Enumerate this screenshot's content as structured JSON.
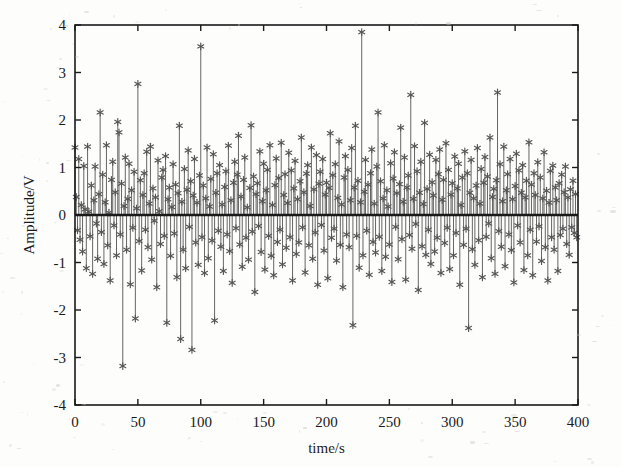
{
  "figure": {
    "background_color": "#fdfdfc",
    "axes_color": "#1a1a1a",
    "data_color": "#555555",
    "marker": "asterisk-marker",
    "plot_box": {
      "left": 75,
      "top": 25,
      "right": 578,
      "bottom": 405
    }
  },
  "chart_data": {
    "type": "line",
    "plot_style": "stem",
    "title": "",
    "subtitle": "",
    "xlabel": "time/s",
    "ylabel": "Amplitude/V",
    "xlim": [
      0,
      400
    ],
    "ylim": [
      -4,
      4
    ],
    "xticks": [
      0,
      50,
      100,
      150,
      200,
      250,
      300,
      350,
      400
    ],
    "xtick_labels": [
      "0",
      "50",
      "100",
      "150",
      "200",
      "250",
      "300",
      "350",
      "400"
    ],
    "yticks": [
      -4,
      -3,
      -2,
      -1,
      0,
      1,
      2,
      3,
      4
    ],
    "ytick_labels": [
      "-4",
      "-3",
      "-2",
      "-1",
      "0",
      "1",
      "2",
      "3",
      "4"
    ],
    "grid": false,
    "legend": null,
    "baseline": 0,
    "marker_symbol": "*",
    "series": [
      {
        "name": "amplitude",
        "x_start": 0,
        "x_step": 1,
        "n_points": 400,
        "values": [
          1.42,
          0.38,
          -0.32,
          1.18,
          -0.52,
          0.21,
          -0.77,
          1.03,
          0.12,
          -1.12,
          1.44,
          0.07,
          -0.45,
          0.62,
          -1.24,
          0.31,
          1.02,
          -0.18,
          -0.92,
          0.44,
          2.16,
          -0.36,
          0.85,
          -1.03,
          0.27,
          1.47,
          -0.64,
          0.05,
          -1.38,
          0.74,
          1.12,
          -0.22,
          0.48,
          -0.85,
          1.96,
          1.74,
          -0.41,
          0.66,
          -3.18,
          0.19,
          1.21,
          -0.73,
          0.34,
          1.08,
          -1.46,
          0.52,
          -0.27,
          0.91,
          -2.18,
          0.14,
          2.76,
          -0.55,
          0.73,
          -1.17,
          0.42,
          0.88,
          -0.31,
          1.33,
          -0.68,
          0.24,
          1.44,
          -0.94,
          0.56,
          -0.12,
          0.37,
          -1.52,
          1.15,
          0.08,
          -0.61,
          0.79,
          0.95,
          -0.44,
          1.24,
          -2.27,
          0.33,
          0.58,
          -0.86,
          0.17,
          1.07,
          -0.39,
          0.64,
          -1.31,
          0.46,
          1.88,
          -2.61,
          0.28,
          -0.73,
          0.97,
          -1.12,
          0.53,
          1.36,
          -0.25,
          0.71,
          -2.84,
          0.41,
          1.18,
          -0.58,
          0.26,
          -1.05,
          0.83,
          3.55,
          -0.47,
          0.62,
          -1.22,
          0.35,
          1.42,
          -0.91,
          0.18,
          0.76,
          -0.54,
          1.28,
          -2.22,
          0.47,
          0.88,
          -0.33,
          1.05,
          -0.67,
          0.22,
          -1.18,
          0.59,
          0.92,
          -0.41,
          1.46,
          -0.76,
          0.31,
          -1.43,
          0.68,
          1.12,
          -0.28,
          0.85,
          1.67,
          -0.62,
          0.39,
          -1.09,
          0.74,
          1.21,
          -0.48,
          0.16,
          -0.94,
          0.57,
          1.89,
          -0.35,
          0.81,
          -1.62,
          0.44,
          0.67,
          -0.23,
          1.34,
          -0.78,
          0.29,
          1.08,
          -1.15,
          0.52,
          0.95,
          -0.44,
          1.47,
          -0.86,
          0.21,
          -1.27,
          0.63,
          1.19,
          -0.57,
          0.78,
          -0.31,
          1.52,
          -1.04,
          0.42,
          0.86,
          -0.69,
          0.25,
          1.31,
          -0.47,
          0.94,
          -1.38,
          0.56,
          1.14,
          -0.82,
          0.33,
          -0.58,
          0.71,
          1.63,
          -0.26,
          0.48,
          -1.21,
          0.87,
          1.05,
          -0.64,
          0.19,
          1.42,
          -0.92,
          0.54,
          -0.37,
          1.26,
          -1.47,
          0.66,
          0.91,
          -0.21,
          1.18,
          -0.75,
          0.43,
          0.68,
          -1.33,
          0.57,
          1.72,
          -0.48,
          0.84,
          -0.29,
          1.07,
          -0.96,
          0.36,
          1.55,
          -0.63,
          0.22,
          -1.52,
          0.79,
          1.24,
          -0.41,
          0.95,
          -0.68,
          0.31,
          1.41,
          -2.32,
          0.58,
          1.88,
          -0.44,
          0.72,
          -1.11,
          0.27,
          3.85,
          -0.85,
          0.49,
          1.16,
          -0.33,
          0.64,
          -1.26,
          0.88,
          1.38,
          -0.57,
          0.24,
          -0.79,
          1.02,
          2.16,
          -0.46,
          0.71,
          -1.18,
          0.35,
          1.47,
          -0.88,
          0.52,
          0.18,
          -0.62,
          1.09,
          -1.41,
          0.77,
          1.32,
          -0.25,
          0.46,
          -0.93,
          0.65,
          1.84,
          -0.51,
          0.28,
          1.21,
          -1.36,
          0.58,
          0.83,
          -0.42,
          2.53,
          -0.71,
          0.34,
          1.45,
          -0.19,
          0.92,
          -1.58,
          0.47,
          1.12,
          -0.66,
          0.23,
          1.94,
          -0.84,
          0.55,
          -0.31,
          1.27,
          -1.03,
          0.69,
          0.41,
          -0.77,
          1.16,
          -0.48,
          0.86,
          1.38,
          -1.22,
          0.32,
          0.74,
          -0.59,
          1.51,
          -0.27,
          0.95,
          -1.14,
          0.43,
          0.67,
          -0.85,
          1.23,
          -0.38,
          0.56,
          1.08,
          -1.47,
          0.21,
          0.79,
          -0.63,
          1.34,
          -0.29,
          0.88,
          -2.38,
          0.47,
          1.16,
          -0.72,
          0.35,
          -1.05,
          0.62,
          1.41,
          -0.53,
          0.24,
          0.97,
          -1.31,
          0.68,
          1.22,
          -0.46,
          0.81,
          -0.18,
          1.63,
          -0.91,
          0.38,
          0.55,
          -1.24,
          0.73,
          2.58,
          -0.34,
          1.07,
          -0.67,
          0.29,
          1.44,
          -1.08,
          0.52,
          0.86,
          -0.41,
          1.18,
          -0.74,
          0.33,
          -1.42,
          0.61,
          1.29,
          -0.22,
          0.94,
          -0.58,
          0.47,
          1.05,
          -1.16,
          0.37,
          0.72,
          -0.85,
          1.53,
          -0.31,
          0.64,
          -1.27,
          0.88,
          0.42,
          -0.56,
          1.11,
          -0.24,
          0.79,
          -0.97,
          0.35,
          1.32,
          -0.68,
          0.51,
          -1.38,
          0.26,
          0.93,
          -0.47,
          1.04,
          -0.73,
          0.58,
          0.31,
          -1.18,
          0.67,
          -0.42,
          0.85,
          -0.29,
          0.48,
          1.02,
          -0.61,
          0.37,
          -0.84,
          0.54,
          -0.26,
          0.72,
          -0.38,
          0.44,
          -0.47
        ]
      }
    ]
  }
}
